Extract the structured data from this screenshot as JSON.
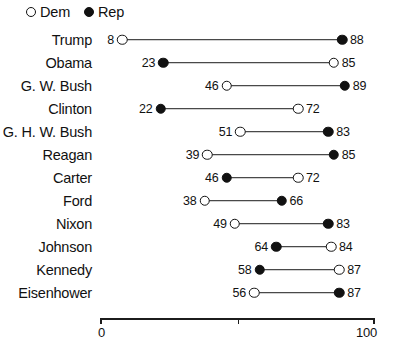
{
  "legend": {
    "items": [
      {
        "label": "Dem",
        "marker": "open-circle-icon",
        "party": "Dem"
      },
      {
        "label": "Rep",
        "marker": "filled-circle-icon",
        "party": "Rep"
      }
    ]
  },
  "axis": {
    "ticks": [
      {
        "value": 0,
        "label": "0"
      },
      {
        "value": 50,
        "label": ""
      },
      {
        "value": 100,
        "label": "100"
      }
    ]
  },
  "colors": {
    "ink": "#111111",
    "background": "#ffffff",
    "connector": "#1c1c1c"
  },
  "chart_data": {
    "type": "line",
    "subtype": "dumbbell",
    "title": "",
    "xlabel": "",
    "ylabel": "",
    "xlim": [
      0,
      100
    ],
    "grid": false,
    "legend_position": "top-left",
    "categories": [
      "Trump",
      "Obama",
      "G. W. Bush",
      "Clinton",
      "G. H. W. Bush",
      "Reagan",
      "Carter",
      "Ford",
      "Nixon",
      "Johnson",
      "Kennedy",
      "Eisenhower"
    ],
    "series": [
      {
        "name": "Dem",
        "marker": "open-circle-icon",
        "values": [
          8,
          85,
          46,
          72,
          51,
          39,
          72,
          38,
          49,
          84,
          87,
          56
        ]
      },
      {
        "name": "Rep",
        "marker": "filled-circle-icon",
        "values": [
          88,
          23,
          89,
          22,
          83,
          85,
          46,
          66,
          83,
          64,
          58,
          87
        ]
      }
    ],
    "rows": [
      {
        "label": "Trump",
        "low": {
          "value": 8,
          "party": "Dem"
        },
        "high": {
          "value": 88,
          "party": "Rep"
        }
      },
      {
        "label": "Obama",
        "low": {
          "value": 23,
          "party": "Rep"
        },
        "high": {
          "value": 85,
          "party": "Dem"
        }
      },
      {
        "label": "G. W. Bush",
        "low": {
          "value": 46,
          "party": "Dem"
        },
        "high": {
          "value": 89,
          "party": "Rep"
        }
      },
      {
        "label": "Clinton",
        "low": {
          "value": 22,
          "party": "Rep"
        },
        "high": {
          "value": 72,
          "party": "Dem"
        }
      },
      {
        "label": "G. H. W. Bush",
        "low": {
          "value": 51,
          "party": "Dem"
        },
        "high": {
          "value": 83,
          "party": "Rep"
        }
      },
      {
        "label": "Reagan",
        "low": {
          "value": 39,
          "party": "Dem"
        },
        "high": {
          "value": 85,
          "party": "Rep"
        }
      },
      {
        "label": "Carter",
        "low": {
          "value": 46,
          "party": "Rep"
        },
        "high": {
          "value": 72,
          "party": "Dem"
        }
      },
      {
        "label": "Ford",
        "low": {
          "value": 38,
          "party": "Dem"
        },
        "high": {
          "value": 66,
          "party": "Rep"
        }
      },
      {
        "label": "Nixon",
        "low": {
          "value": 49,
          "party": "Dem"
        },
        "high": {
          "value": 83,
          "party": "Rep"
        }
      },
      {
        "label": "Johnson",
        "low": {
          "value": 64,
          "party": "Rep"
        },
        "high": {
          "value": 84,
          "party": "Dem"
        }
      },
      {
        "label": "Kennedy",
        "low": {
          "value": 58,
          "party": "Rep"
        },
        "high": {
          "value": 87,
          "party": "Dem"
        }
      },
      {
        "label": "Eisenhower",
        "low": {
          "value": 56,
          "party": "Dem"
        },
        "high": {
          "value": 87,
          "party": "Rep"
        }
      }
    ]
  }
}
